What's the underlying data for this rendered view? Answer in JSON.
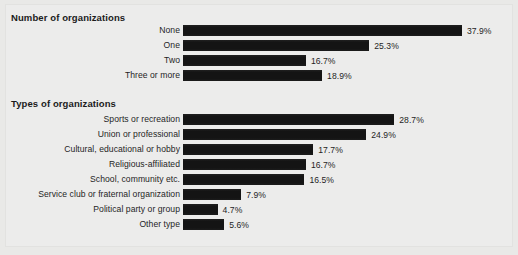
{
  "figure": {
    "background_color": "#e9e9e7",
    "panel_color": "#ecece b",
    "bar_color": "#141414"
  },
  "chart_data": {
    "type": "bar",
    "orientation": "horizontal",
    "title": "",
    "xlabel": "",
    "ylabel": "",
    "grid": false,
    "legend": null,
    "value_suffix": "%",
    "xlim": [
      0,
      40
    ],
    "panels": [
      {
        "title": "Number of organizations",
        "categories": [
          "None",
          "One",
          "Two",
          "Three or more"
        ],
        "values": [
          37.9,
          25.3,
          16.7,
          18.9
        ],
        "labels": [
          "37.9%",
          "25.3%",
          "16.7%",
          "18.9%"
        ]
      },
      {
        "title": "Types of organizations",
        "categories": [
          "Sports or recreation",
          "Union or professional",
          "Cultural, educational or hobby",
          "Religious-affiliated",
          "School, community etc.",
          "Service club or fraternal organization",
          "Political party or group",
          "Other type"
        ],
        "values": [
          28.7,
          24.9,
          17.7,
          16.7,
          16.5,
          7.9,
          4.7,
          5.6
        ],
        "labels": [
          "28.7%",
          "24.9%",
          "17.7%",
          "16.7%",
          "16.5%",
          "7.9%",
          "4.7%",
          "5.6%"
        ]
      }
    ]
  }
}
